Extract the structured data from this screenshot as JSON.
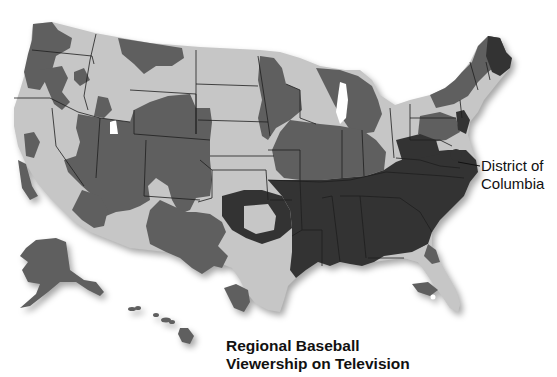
{
  "caption": {
    "line1": "Regional Baseball",
    "line2": "Viewership on Television"
  },
  "annotations": {
    "dc_line1": "District of",
    "dc_line2": "Columbia"
  },
  "map": {
    "region": "United States",
    "shading_levels": [
      {
        "name": "light",
        "color": "#c6c6c6"
      },
      {
        "name": "medium",
        "color": "#5f5f5f"
      },
      {
        "name": "dark",
        "color": "#333333"
      },
      {
        "name": "none",
        "color": "#ffffff"
      }
    ],
    "insets": [
      "Alaska",
      "Hawaii"
    ]
  }
}
